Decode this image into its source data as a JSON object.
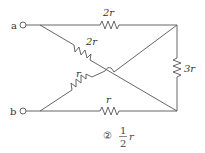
{
  "diagram": {
    "type": "resistor-network",
    "terminals": [
      {
        "id": "a",
        "label": "a"
      },
      {
        "id": "b",
        "label": "b"
      }
    ],
    "resistors": [
      {
        "id": "top",
        "label": "2r",
        "value": "2r",
        "between": "a-topright"
      },
      {
        "id": "diag-a",
        "label": "2r",
        "value": "2r",
        "between": "a-bottomright"
      },
      {
        "id": "right",
        "label": "3r",
        "value": "3r",
        "between": "topright-bottomright"
      },
      {
        "id": "diag-b",
        "label": "r",
        "value": "r",
        "between": "b-topright"
      },
      {
        "id": "bottom",
        "label": "r",
        "value": "r",
        "between": "b-bottomright"
      }
    ]
  },
  "answer": {
    "choice_symbol": "②",
    "numerator": "1",
    "denominator": "2",
    "variable": "r"
  }
}
